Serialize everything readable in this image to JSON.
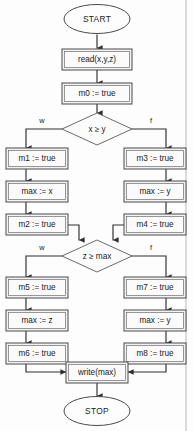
{
  "diagram": {
    "colors": {
      "box_fill": "#f2f2f2",
      "box_inner_fill": "#fbfbfb",
      "box_border": "#4a4a4a",
      "line": "#2e2e2e",
      "text": "#1a1a1a",
      "background": "#fdfdfd"
    },
    "start": {
      "label": "START"
    },
    "stop": {
      "label": "STOP"
    },
    "nodes": {
      "read": {
        "label": "read(x,y,z)"
      },
      "m0": {
        "label": "m0 := true"
      },
      "m1": {
        "label": "m1 := true"
      },
      "max_x": {
        "label": "max := x"
      },
      "m2": {
        "label": "m2 := true"
      },
      "m3": {
        "label": "m3 := true"
      },
      "max_y1": {
        "label": "max := y"
      },
      "m4": {
        "label": "m4 := true"
      },
      "m5": {
        "label": "m5 := true"
      },
      "max_z": {
        "label": "max := z"
      },
      "m6": {
        "label": "m6 := true"
      },
      "m7": {
        "label": "m7 := true"
      },
      "max_y2": {
        "label": "max := y"
      },
      "m8": {
        "label": "m8 := true"
      },
      "write": {
        "label": "write(max)"
      }
    },
    "decisions": {
      "d1": {
        "label": "x ≥ y",
        "true_branch": "w",
        "false_branch": "f"
      },
      "d2": {
        "label": "z ≥ max",
        "true_branch": "w",
        "false_branch": "f"
      }
    }
  }
}
